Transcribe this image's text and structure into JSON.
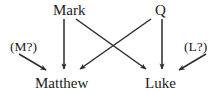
{
  "diagram": {
    "background_color": "#ffffff",
    "line_color": "#2b2b2b",
    "text_color": "#1a1a1a",
    "nodes": {
      "mark": {
        "label": "Mark",
        "role": "source",
        "x": 73,
        "y": 10
      },
      "q": {
        "label": "Q",
        "role": "source",
        "x": 162,
        "y": 10
      },
      "m": {
        "label": "(M?)",
        "role": "hypothetical",
        "x": 28,
        "y": 47
      },
      "l": {
        "label": "(L?)",
        "role": "hypothetical",
        "x": 197,
        "y": 47
      },
      "matthew": {
        "label": "Matthew",
        "role": "derived",
        "x": 66,
        "y": 83
      },
      "luke": {
        "label": "Luke",
        "role": "derived",
        "x": 163,
        "y": 83
      }
    },
    "edges": [
      {
        "from": "mark",
        "to": "matthew",
        "style": "vertical",
        "x1": 64,
        "y1": 19,
        "x2": 64,
        "y2": 70
      },
      {
        "from": "q",
        "to": "luke",
        "style": "vertical",
        "x1": 162,
        "y1": 19,
        "x2": 162,
        "y2": 70
      },
      {
        "from": "mark",
        "to": "luke",
        "style": "diagonal",
        "x1": 76,
        "y1": 19,
        "x2": 147,
        "y2": 70
      },
      {
        "from": "q",
        "to": "matthew",
        "style": "diagonal",
        "x1": 151,
        "y1": 19,
        "x2": 79,
        "y2": 70
      },
      {
        "from": "m",
        "to": "matthew",
        "style": "diagonal",
        "x1": 19,
        "y1": 54,
        "x2": 47,
        "y2": 71
      },
      {
        "from": "l",
        "to": "luke",
        "style": "diagonal",
        "x1": 206,
        "y1": 54,
        "x2": 178,
        "y2": 71
      }
    ],
    "crossing_point": {
      "x": 113,
      "y": 46
    }
  }
}
